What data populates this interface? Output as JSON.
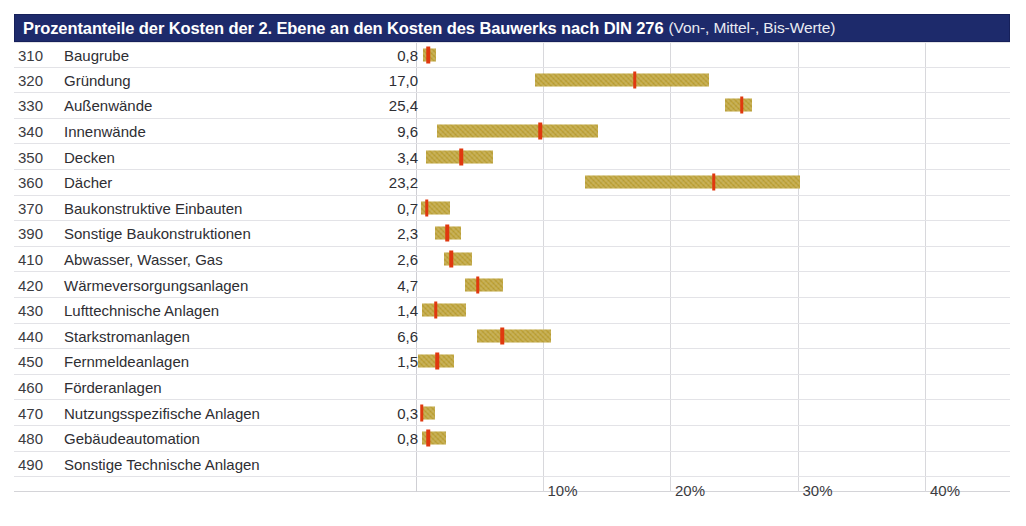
{
  "title": {
    "main": "Prozentanteile der Kosten der 2. Ebene an den Kosten des Bauwerks nach DIN 276",
    "sub": "(Von-, Mittel-, Bis-Werte)"
  },
  "colors": {
    "title_bar": "#1d2a6b",
    "bar": "#bfa337",
    "marker": "#e0380f",
    "gridline": "#d8d8dc",
    "row_rule": "#e3e3e7"
  },
  "chart_data": {
    "type": "bar",
    "title": "Prozentanteile der Kosten der 2. Ebene an den Kosten des Bauwerks nach DIN 276 (Von-, Mittel-, Bis-Werte)",
    "xlabel": "",
    "ylabel": "",
    "xlim": [
      0,
      44
    ],
    "grid": true,
    "legend": "none",
    "value_format": "percent",
    "x_ticks": [
      "10%",
      "20%",
      "30%",
      "40%"
    ],
    "x_tick_values": [
      10,
      20,
      30,
      40
    ],
    "columns": [
      "Kostengruppe",
      "Bezeichnung",
      "Mittelwert"
    ],
    "rows": [
      {
        "code": "310",
        "label": "Baugrube",
        "value": "0,8",
        "mittel": 0.8,
        "von": 0.4,
        "bis": 1.4
      },
      {
        "code": "320",
        "label": "Gründung",
        "value": "17,0",
        "mittel": 17.0,
        "von": 9.2,
        "bis": 22.8
      },
      {
        "code": "330",
        "label": "Außenwände",
        "value": "25,4",
        "mittel": 25.4,
        "von": 24.1,
        "bis": 26.2
      },
      {
        "code": "340",
        "label": "Innenwände",
        "value": "9,6",
        "mittel": 9.6,
        "von": 1.5,
        "bis": 14.1
      },
      {
        "code": "350",
        "label": "Decken",
        "value": "3,4",
        "mittel": 3.4,
        "von": 0.6,
        "bis": 5.9
      },
      {
        "code": "360",
        "label": "Dächer",
        "value": "23,2",
        "mittel": 23.2,
        "von": 13.1,
        "bis": 30.0
      },
      {
        "code": "370",
        "label": "Baukonstruktive Einbauten",
        "value": "0,7",
        "mittel": 0.7,
        "von": 0.2,
        "bis": 2.5
      },
      {
        "code": "390",
        "label": "Sonstige Baukonstruktionen",
        "value": "2,3",
        "mittel": 2.3,
        "von": 1.3,
        "bis": 3.4
      },
      {
        "code": "410",
        "label": "Abwasser, Wasser, Gas",
        "value": "2,6",
        "mittel": 2.6,
        "von": 2.0,
        "bis": 4.2
      },
      {
        "code": "420",
        "label": "Wärmeversorgungsanlagen",
        "value": "4,7",
        "mittel": 4.7,
        "von": 3.7,
        "bis": 6.7
      },
      {
        "code": "430",
        "label": "Lufttechnische Anlagen",
        "value": "1,4",
        "mittel": 1.4,
        "von": 0.3,
        "bis": 3.8
      },
      {
        "code": "440",
        "label": "Starkstromanlagen",
        "value": "6,6",
        "mittel": 6.6,
        "von": 4.6,
        "bis": 10.4
      },
      {
        "code": "450",
        "label": "Fernmeldeanlagen",
        "value": "1,5",
        "mittel": 1.5,
        "von": 0.0,
        "bis": 2.8
      },
      {
        "code": "460",
        "label": "Förderanlagen",
        "value": "",
        "mittel": null,
        "von": null,
        "bis": null
      },
      {
        "code": "470",
        "label": "Nutzungsspezifische Anlagen",
        "value": "0,3",
        "mittel": 0.3,
        "von": 0.3,
        "bis": 1.3
      },
      {
        "code": "480",
        "label": "Gebäudeautomation",
        "value": "0,8",
        "mittel": 0.8,
        "von": 0.3,
        "bis": 2.2
      },
      {
        "code": "490",
        "label": "Sonstige Technische Anlagen",
        "value": "",
        "mittel": null,
        "von": null,
        "bis": null
      }
    ]
  }
}
